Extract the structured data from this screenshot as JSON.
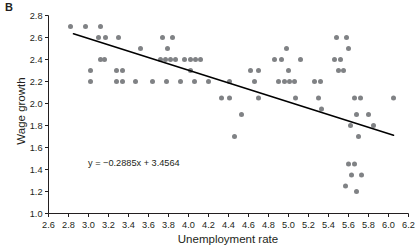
{
  "panel": {
    "label": "B"
  },
  "chart_data": {
    "type": "scatter",
    "title": "",
    "xlabel": "Unemployment rate",
    "ylabel": "Wage growth",
    "xlim": [
      2.6,
      6.2
    ],
    "ylim": [
      1.0,
      2.8
    ],
    "xticks": [
      2.6,
      2.8,
      3.0,
      3.2,
      3.4,
      3.6,
      3.8,
      4.0,
      4.2,
      4.4,
      4.6,
      4.8,
      5.0,
      5.2,
      5.4,
      5.6,
      5.8,
      6.0,
      6.2
    ],
    "xtick_labels": [
      "2.6",
      "2.8",
      "3.0",
      "3.2",
      "3.4",
      "3.6",
      "3.8",
      "4.0",
      "4.2",
      "4.4",
      "4.6",
      "4.8",
      "5.0",
      "5.2",
      "5.4",
      "5.6",
      "5.8",
      "6.0",
      "6.2"
    ],
    "yticks": [
      1.0,
      1.2,
      1.4,
      1.6,
      1.8,
      2.0,
      2.2,
      2.4,
      2.6,
      2.8
    ],
    "ytick_labels": [
      "1.0",
      "1.2",
      "1.4",
      "1.6",
      "1.8",
      "2.0",
      "2.2",
      "2.4",
      "2.6",
      "2.8"
    ],
    "grid": false,
    "legend": null,
    "marker_color": "#808285",
    "line_color": "#000000",
    "axis_color": "#231f20",
    "annotation": "y = −0.2885x + 3.4564",
    "trendline": {
      "slope": -0.2885,
      "intercept": 3.4564,
      "x_start": 2.85,
      "x_end": 6.05
    },
    "points": [
      [
        2.82,
        2.7
      ],
      [
        2.97,
        2.7
      ],
      [
        3.12,
        2.7
      ],
      [
        3.1,
        2.6
      ],
      [
        3.17,
        2.6
      ],
      [
        3.3,
        2.6
      ],
      [
        3.12,
        2.4
      ],
      [
        3.16,
        2.4
      ],
      [
        3.02,
        2.3
      ],
      [
        3.02,
        2.2
      ],
      [
        3.28,
        2.3
      ],
      [
        3.34,
        2.3
      ],
      [
        3.28,
        2.2
      ],
      [
        3.34,
        2.2
      ],
      [
        3.47,
        2.2
      ],
      [
        3.52,
        2.5
      ],
      [
        3.74,
        2.6
      ],
      [
        3.84,
        2.6
      ],
      [
        3.79,
        2.5
      ],
      [
        3.72,
        2.4
      ],
      [
        3.77,
        2.4
      ],
      [
        3.82,
        2.4
      ],
      [
        3.87,
        2.4
      ],
      [
        3.96,
        2.4
      ],
      [
        4.02,
        2.4
      ],
      [
        4.07,
        2.4
      ],
      [
        4.12,
        2.4
      ],
      [
        4.02,
        2.3
      ],
      [
        3.64,
        2.2
      ],
      [
        3.78,
        2.2
      ],
      [
        3.92,
        2.2
      ],
      [
        4.06,
        2.2
      ],
      [
        4.2,
        2.2
      ],
      [
        4.33,
        2.05
      ],
      [
        4.41,
        2.2
      ],
      [
        4.41,
        2.05
      ],
      [
        4.46,
        1.7
      ],
      [
        4.53,
        1.9
      ],
      [
        4.62,
        2.3
      ],
      [
        4.7,
        2.3
      ],
      [
        4.66,
        2.2
      ],
      [
        4.7,
        2.05
      ],
      [
        4.98,
        2.5
      ],
      [
        4.86,
        2.4
      ],
      [
        4.93,
        2.4
      ],
      [
        5.0,
        2.3
      ],
      [
        4.9,
        2.2
      ],
      [
        4.96,
        2.2
      ],
      [
        5.01,
        2.2
      ],
      [
        5.06,
        2.2
      ],
      [
        5.07,
        2.05
      ],
      [
        5.12,
        2.4
      ],
      [
        5.26,
        2.2
      ],
      [
        5.32,
        2.2
      ],
      [
        5.3,
        2.05
      ],
      [
        5.33,
        1.95
      ],
      [
        5.48,
        2.6
      ],
      [
        5.58,
        2.6
      ],
      [
        5.6,
        2.5
      ],
      [
        5.46,
        2.4
      ],
      [
        5.52,
        2.4
      ],
      [
        5.5,
        2.3
      ],
      [
        5.55,
        2.3
      ],
      [
        5.66,
        2.05
      ],
      [
        5.72,
        2.05
      ],
      [
        6.05,
        2.05
      ],
      [
        5.68,
        1.9
      ],
      [
        5.8,
        1.9
      ],
      [
        5.62,
        1.8
      ],
      [
        5.85,
        1.8
      ],
      [
        5.7,
        1.7
      ],
      [
        5.6,
        1.45
      ],
      [
        5.66,
        1.45
      ],
      [
        5.63,
        1.35
      ],
      [
        5.73,
        1.35
      ],
      [
        5.57,
        1.25
      ],
      [
        5.68,
        1.2
      ]
    ]
  }
}
